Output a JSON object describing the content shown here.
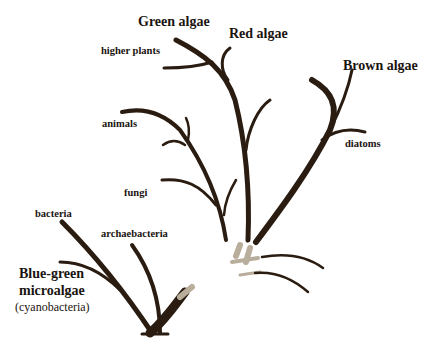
{
  "diagram": {
    "type": "evolutionary-tree",
    "colors": {
      "branch": "#2a1c10",
      "background": "#ffffff",
      "text": "#1a1410"
    },
    "labels": {
      "green_algae": "Green algae",
      "red_algae": "Red algae",
      "brown_algae": "Brown algae",
      "higher_plants": "higher plants",
      "animals": "animals",
      "diatoms": "diatoms",
      "fungi": "fungi",
      "bacteria": "bacteria",
      "archaebacteria": "archaebacteria",
      "blue_green_line1": "Blue-green",
      "blue_green_line2": "microalgae",
      "cyanobacteria": "(cyanobacteria)"
    }
  }
}
